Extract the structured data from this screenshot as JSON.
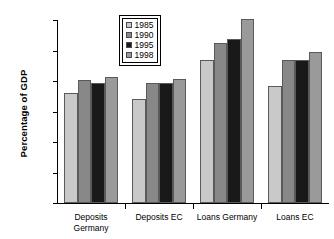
{
  "chart_data": {
    "type": "bar",
    "title": "",
    "subtitle": "",
    "xlabel": "",
    "ylabel": "Percentage of GDP",
    "categories": [
      "Deposits\nGermany",
      "Deposits EC",
      "Loans Germany",
      "Loans EC"
    ],
    "series": [
      {
        "name": "1985",
        "color": "#c9c9c9",
        "values": [
          90,
          85,
          117.5,
          96
        ]
      },
      {
        "name": "1990",
        "color": "#888888",
        "values": [
          101,
          98.5,
          131,
          117
        ]
      },
      {
        "name": "1995",
        "color": "#191919",
        "values": [
          98,
          98.5,
          134.5,
          117
        ]
      },
      {
        "name": "1998",
        "color": "#9a9a9a",
        "values": [
          103,
          102,
          151,
          124
        ]
      }
    ],
    "ylim": [
      0,
      150
    ],
    "ytick_values": [
      0,
      25,
      50,
      75,
      100,
      125,
      150
    ],
    "ytick_labels": [
      "0%",
      "25%",
      "50%",
      "75%",
      "100%",
      "125%",
      "150%"
    ],
    "grid": false,
    "legend_position": "upper-center",
    "axis_color": "#000000",
    "background_color": "#ffffff"
  },
  "legend": {
    "entries": [
      "1985",
      "1990",
      "1995",
      "1998"
    ]
  }
}
